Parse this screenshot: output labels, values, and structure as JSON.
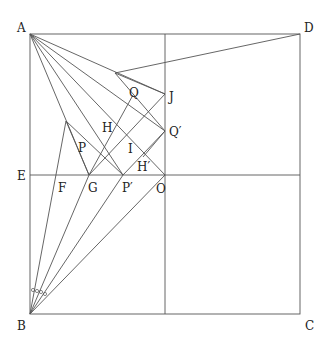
{
  "diagram": {
    "type": "geometry-figure",
    "labels": {
      "A": "A",
      "B": "B",
      "C": "C",
      "D": "D",
      "E": "E",
      "F": "F",
      "G": "G",
      "H": "H",
      "I": "I",
      "J": "J",
      "O": "O",
      "P": "P",
      "Q": "Q",
      "Pp": "P′",
      "Qp": "Q′",
      "Hp": "H′"
    },
    "points": {
      "A": [
        30,
        34
      ],
      "B": [
        30,
        314
      ],
      "C": [
        300,
        314
      ],
      "D": [
        300,
        34
      ],
      "E": [
        30,
        175
      ],
      "O": [
        165,
        175
      ],
      "J": [
        165,
        94
      ],
      "Qp": [
        165,
        131
      ],
      "G": [
        89,
        175
      ],
      "Pp": [
        123,
        175
      ],
      "F": [
        55,
        175
      ],
      "K": [
        115,
        73
      ],
      "T": [
        66,
        121
      ]
    },
    "angle_marks": "five equal angle arcs at B"
  }
}
